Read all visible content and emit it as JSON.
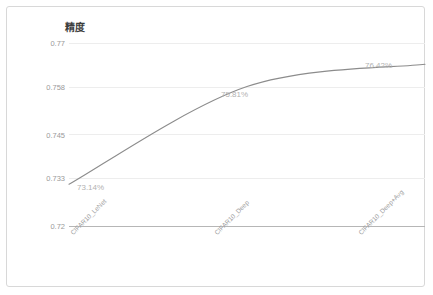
{
  "chart_data": {
    "type": "line",
    "title": "精度",
    "xlabel": "",
    "ylabel": "",
    "categories": [
      "CIFAR10_LeNet",
      "CIFAR10_Deep",
      "CIFAR10_Deep+Avg"
    ],
    "values": [
      0.7314,
      0.7581,
      0.7642
    ],
    "data_labels": [
      "73.14%",
      "75.81%",
      "76.42%"
    ],
    "ylim": [
      0.72,
      0.77
    ],
    "y_ticks": [
      0.77,
      0.758,
      0.745,
      0.733,
      0.72
    ],
    "y_tick_labels": [
      "0.77",
      "0.758",
      "0.745",
      "0.733",
      "0.72"
    ],
    "grid": true,
    "legend": false,
    "series": [
      {
        "name": "精度",
        "values": [
          0.7314,
          0.7581,
          0.7642
        ],
        "color": "#8c8c8c",
        "smooth": true
      }
    ],
    "colors": {
      "line": "#8c8c8c",
      "gridline": "#ededed",
      "axis": "#b6b6b6",
      "tick_text": "#9a9a9a",
      "label_text": "#b2b2b2",
      "title_text": "#3d3d3d",
      "frame_border": "#d8d8d8",
      "background": "#ffffff"
    }
  }
}
